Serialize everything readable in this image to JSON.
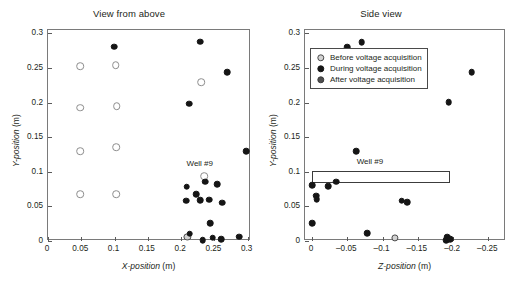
{
  "figure": {
    "width": 510,
    "height": 285,
    "background": "#ffffff"
  },
  "legend": {
    "position": "upper-left-of-right-panel",
    "entries": [
      {
        "key": "before",
        "label": "Before voltage acquisition",
        "color": "#d2d2d2",
        "edge": "#4a4a4a"
      },
      {
        "key": "during",
        "label": "During voltage acquisition",
        "color": "#151515",
        "edge": "#151515"
      },
      {
        "key": "after",
        "label": "After voltage acquisition",
        "color": "#4f4f4f",
        "edge": "#3a3a3a"
      }
    ]
  },
  "chart_data": [
    {
      "id": "view-from-above",
      "type": "scatter",
      "title": "View from above",
      "xlabel": "X-position",
      "xunit": "(m)",
      "ylabel": "Y-position",
      "yunit": "(m)",
      "xlim": [
        0,
        0.305
      ],
      "ylim": [
        0,
        0.305
      ],
      "xticks": [
        0,
        0.05,
        0.1,
        0.15,
        0.2,
        0.25,
        0.3
      ],
      "xticklabels": [
        "0",
        "0.05",
        "0.1",
        "0.15",
        "0.2",
        "0.25",
        "0.3"
      ],
      "yticks": [
        0,
        0.05,
        0.1,
        0.15,
        0.2,
        0.25,
        0.3
      ],
      "yticklabels": [
        "0",
        "0.05",
        "0.1",
        "0.15",
        "0.2",
        "0.25",
        "0.3"
      ],
      "grid": false,
      "annotations": [
        {
          "text": "Well #9",
          "x": 0.2295,
          "y": 0.1105
        }
      ],
      "series": [
        {
          "name": "Well grid (open markers)",
          "marker": "open",
          "points": [
            [
              0.048,
              0.253
            ],
            [
              0.102,
              0.2545
            ],
            [
              0.048,
              0.1925
            ],
            [
              0.103,
              0.195
            ],
            [
              0.048,
              0.13
            ],
            [
              0.1025,
              0.1355
            ],
            [
              0.048,
              0.068
            ],
            [
              0.1025,
              0.068
            ],
            [
              0.23,
              0.2295
            ],
            [
              0.2345,
              0.094
            ]
          ]
        },
        {
          "name": "Before voltage acquisition",
          "marker": "before",
          "points": [
            [
              0.2095,
              0.0055
            ]
          ]
        },
        {
          "name": "During voltage acquisition",
          "marker": "during",
          "points": [
            [
              0.0995,
              0.281
            ],
            [
              0.229,
              0.288
            ],
            [
              0.269,
              0.244
            ],
            [
              0.2125,
              0.1985
            ],
            [
              0.298,
              0.13
            ],
            [
              0.236,
              0.086
            ],
            [
              0.2545,
              0.0825
            ],
            [
              0.2085,
              0.0785
            ],
            [
              0.2225,
              0.0675
            ],
            [
              0.2075,
              0.058
            ],
            [
              0.229,
              0.059
            ],
            [
              0.2425,
              0.0595
            ],
            [
              0.262,
              0.0555
            ],
            [
              0.244,
              0.0255
            ],
            [
              0.213,
              0.0105
            ],
            [
              0.2325,
              0.0015
            ],
            [
              0.2475,
              0.0045
            ],
            [
              0.26,
              0.003
            ],
            [
              0.2875,
              0.0065
            ]
          ]
        }
      ]
    },
    {
      "id": "side-view",
      "type": "scatter",
      "title": "Side view",
      "xlabel": "Z-position",
      "xunit": "(m)",
      "ylabel": "Y-position",
      "yunit": "(m)",
      "xlim": [
        0.01,
        -0.275
      ],
      "ylim": [
        0,
        0.305
      ],
      "xticks": [
        0,
        -0.05,
        -0.1,
        -0.15,
        -0.2,
        -0.25
      ],
      "xticklabels": [
        "0",
        "–0.05",
        "–0.1",
        "–0.15",
        "–0.2",
        "–0.25"
      ],
      "yticks": [
        0,
        0.05,
        0.1,
        0.15,
        0.2,
        0.25,
        0.3
      ],
      "yticklabels": [
        "0",
        "0.05",
        "0.1",
        "0.15",
        "0.2",
        "0.25",
        "0.3"
      ],
      "grid": false,
      "annotations": [
        {
          "text": "Well #9",
          "x": -0.0835,
          "y": 0.1125
        }
      ],
      "shapes": [
        {
          "type": "rect",
          "name": "well-9-outline",
          "x0": 0.0005,
          "x1": -0.196,
          "y0": 0.0845,
          "y1": 0.1005
        }
      ],
      "series": [
        {
          "name": "Before voltage acquisition",
          "marker": "before",
          "points": [
            [
              -0.1175,
              0.0045
            ]
          ]
        },
        {
          "name": "During voltage acquisition",
          "marker": "during",
          "points": [
            [
              -0.05,
              0.2805
            ],
            [
              -0.0705,
              0.287
            ],
            [
              -0.2265,
              0.244
            ],
            [
              -0.1935,
              0.2005
            ],
            [
              -0.0625,
              0.13
            ],
            [
              -0.0005,
              0.0805
            ],
            [
              -0.0345,
              0.0855
            ],
            [
              -0.0225,
              0.079
            ],
            [
              -0.0055,
              0.0655
            ],
            [
              -0.0065,
              0.06
            ],
            [
              -0.127,
              0.0585
            ],
            [
              -0.1345,
              0.056
            ],
            [
              -0.0005,
              0.0255
            ],
            [
              -0.078,
              0.0115
            ],
            [
              -0.192,
              0.0055
            ],
            [
              -0.1905,
              0.0015
            ],
            [
              -0.1955,
              0.003
            ]
          ]
        }
      ]
    }
  ]
}
